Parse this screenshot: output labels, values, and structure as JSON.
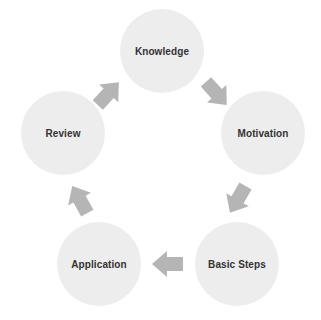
{
  "diagram": {
    "type": "cycle",
    "direction": "clockwise",
    "colors": {
      "node_fill": "#ededed",
      "arrow_fill": "#b5b5b5",
      "label_text": "#333333",
      "background": "#ffffff"
    },
    "nodes": [
      {
        "id": "knowledge",
        "label": "Knowledge",
        "position": "top"
      },
      {
        "id": "motivation",
        "label": "Motivation",
        "position": "right"
      },
      {
        "id": "basic-steps",
        "label": "Basic Steps",
        "position": "bottom-right"
      },
      {
        "id": "application",
        "label": "Application",
        "position": "bottom-left"
      },
      {
        "id": "review",
        "label": "Review",
        "position": "left"
      }
    ],
    "arrows": [
      {
        "id": "arrow-knowledge-to-motivation",
        "from": "knowledge",
        "to": "motivation",
        "direction": "down-right"
      },
      {
        "id": "arrow-motivation-to-basicsteps",
        "from": "motivation",
        "to": "basic-steps",
        "direction": "down-left"
      },
      {
        "id": "arrow-basicsteps-to-application",
        "from": "basic-steps",
        "to": "application",
        "direction": "left"
      },
      {
        "id": "arrow-application-to-review",
        "from": "application",
        "to": "review",
        "direction": "up-right"
      },
      {
        "id": "arrow-review-to-knowledge",
        "from": "review",
        "to": "knowledge",
        "direction": "up-right"
      }
    ]
  }
}
